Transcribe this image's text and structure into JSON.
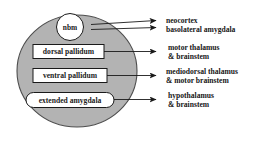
{
  "diagram": {
    "colors": {
      "region_fill": "#b3b3b3",
      "region_stroke": "#4d4d4d",
      "node_fill": "#ffffff",
      "node_stroke": "#1a1a1a",
      "arrow": "#1a1a1a",
      "text": "#161616",
      "background": "#ffffff"
    },
    "region": {
      "name": "basal-forebrain-ellipse",
      "shape": "ellipse"
    },
    "nodes": [
      {
        "id": "nbm",
        "label": "nbm",
        "shape": "circle"
      },
      {
        "id": "dorsal-pallidum",
        "label": "dorsal pallidum",
        "shape": "rectangle"
      },
      {
        "id": "ventral-pallidum",
        "label": "ventral pallidum",
        "shape": "rectangle"
      },
      {
        "id": "extended-amygdala",
        "label": "extended amygdala",
        "shape": "rounded-rectangle"
      }
    ],
    "targets": [
      {
        "id": "target-neocortex",
        "source": "nbm",
        "lines": [
          "neocortex"
        ]
      },
      {
        "id": "target-basolateral-amygdala",
        "source": "nbm",
        "lines": [
          "basolateral amygdala"
        ]
      },
      {
        "id": "target-motor-thalamus",
        "source": "dorsal-pallidum",
        "lines": [
          "motor thalamus",
          "& brainstem"
        ]
      },
      {
        "id": "target-mediodorsal-thalamus",
        "source": "ventral-pallidum",
        "lines": [
          "mediodorsal thalamus",
          "& motor brainstem"
        ]
      },
      {
        "id": "target-hypothalamus",
        "source": "extended-amygdala",
        "lines": [
          "hypothalamus",
          "& brainstem"
        ]
      }
    ]
  }
}
